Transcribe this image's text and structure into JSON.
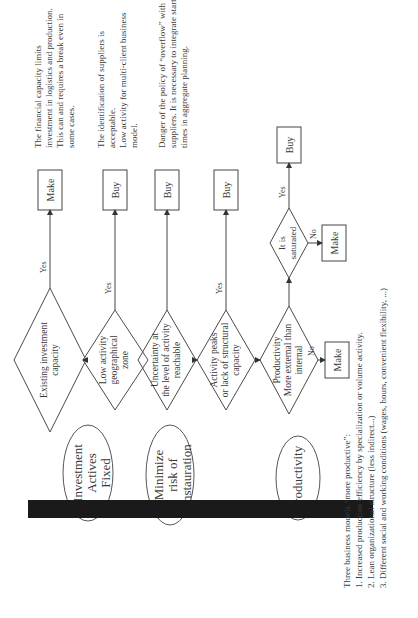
{
  "figure": {
    "orientation": "rotated 90 degrees counter-clockwise",
    "objectives": [
      {
        "label_lines": [
          "Investment",
          "Actives",
          "Fixed"
        ]
      },
      {
        "label_lines": [
          "Minimize",
          "risk of",
          "instauration"
        ]
      },
      {
        "label_lines": [
          "Productivity"
        ]
      }
    ],
    "decisions": [
      {
        "label_lines": [
          "Existing investment",
          "capacity"
        ],
        "branch": "Yes",
        "outcome": "Make",
        "note_lines": [
          "The financial capacity limits",
          "investment in logistics and production.",
          "This can and requires a break even in",
          "some cases."
        ]
      },
      {
        "label_lines": [
          "Low activity",
          "geographical",
          "zone"
        ],
        "branch": "Yes",
        "outcome": "Buy",
        "note_lines": [
          "The identification of suppliers is",
          "acceptable.",
          "Low activity for multi-client business",
          "model."
        ]
      },
      {
        "label_lines": [
          "Uncertainty at",
          "the level of activity",
          "reachable"
        ],
        "branch": "",
        "outcome": "Buy"
      },
      {
        "label_lines": [
          "Activity peaks",
          "or lack of structural",
          "capacity"
        ],
        "branch": "Yes",
        "outcome": "Buy",
        "note_lines": [
          "Danger of the policy of “overflow” with",
          "suppliers. It is necessary to integrate start up",
          "times in aggregate planning."
        ]
      },
      {
        "label_lines": [
          "Productivity",
          "More external than",
          "internal"
        ],
        "branch_no": "No",
        "outcome_no": "Make"
      }
    ],
    "saturation": {
      "label_lines": [
        "It is",
        "saturated"
      ],
      "yes_label": "Yes",
      "yes_outcome": "Buy",
      "no_label": "No",
      "no_outcome": "Make"
    },
    "footnote": {
      "title": "Three business models “more productive”:",
      "items": [
        "1. Increased production efficiency by specialization or volume activity.",
        "2. Lean organizational structure (less indirect...)",
        "3. Different social and working conditions (wages, hours, convenient flexibility, ...)"
      ]
    },
    "colors": {
      "line": "#4a4a4a",
      "arrow": "#1a1a1a",
      "text": "#3a3a3a"
    }
  }
}
